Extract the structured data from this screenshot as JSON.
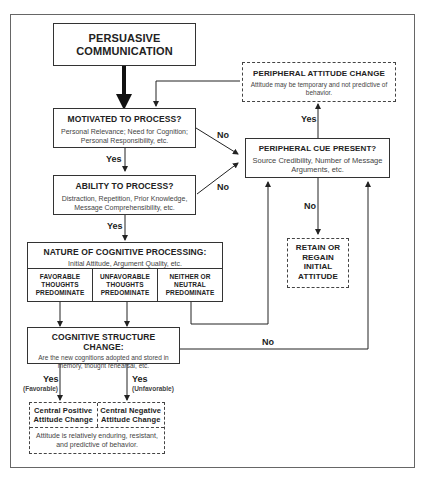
{
  "header_fragment": "any purpose",
  "nodes": {
    "persuasive_communication": {
      "title": "PERSUASIVE COMMUNICATION"
    },
    "motivated": {
      "title": "MOTIVATED TO PROCESS?",
      "detail": "Personal Relevance; Need for Cognition; Personal Responsibility, etc."
    },
    "ability": {
      "title": "ABILITY TO PROCESS?",
      "detail": "Distraction, Repetition, Prior Knowledge, Message Comprehensibility, etc."
    },
    "nature": {
      "title": "NATURE OF COGNITIVE PROCESSING:",
      "detail": "Initial Attitude, Argument Quality, etc.",
      "cells": [
        "FAVORABLE THOUGHTS PREDOMINATE",
        "UNFAVORABLE THOUGHTS PREDOMINATE",
        "NEITHER OR NEUTRAL PREDOMINATE"
      ]
    },
    "cognitive_structure": {
      "title": "COGNITIVE STRUCTURE CHANGE:",
      "detail": "Are the new cognitions adopted and stored in memory, thought rehearsal, etc."
    },
    "central": {
      "positive": "Central Positive Attitude Change",
      "negative": "Central Negative Attitude Change",
      "detail": "Attitude is relatively enduring, resistant, and predictive of behavior."
    },
    "peripheral_change": {
      "title": "PERIPHERAL ATTITUDE CHANGE",
      "detail": "Attitude may be temporary and not predictive of behavior."
    },
    "peripheral_cue": {
      "title": "PERIPHERAL CUE PRESENT?",
      "detail": "Source Credibility, Number of Message Arguments, etc."
    },
    "retain": {
      "title": "RETAIN OR REGAIN INITIAL ATTITUDE"
    }
  },
  "edge_labels": {
    "yes": "Yes",
    "no": "No",
    "favorable": "(Favorable)",
    "unfavorable": "(Unfavorable)"
  }
}
